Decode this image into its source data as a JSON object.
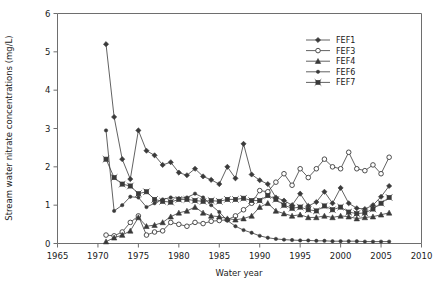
{
  "chart_data": {
    "type": "line",
    "title": "",
    "xlabel": "Water year",
    "ylabel": "Stream water nitrate concentrations (mg/L)",
    "xlim": [
      1965,
      2010
    ],
    "ylim": [
      0,
      6
    ],
    "xticks": [
      1965,
      1970,
      1975,
      1980,
      1985,
      1990,
      1995,
      2000,
      2005,
      2010
    ],
    "yticks": [
      0,
      1,
      2,
      3,
      4,
      5,
      6
    ],
    "grid": false,
    "legend_position": "top-right",
    "series": [
      {
        "name": "FEF1",
        "marker": "filled-diamond",
        "x": [
          1971,
          1972,
          1973,
          1974,
          1975,
          1976,
          1977,
          1978,
          1979,
          1980,
          1981,
          1982,
          1983,
          1984,
          1985,
          1986,
          1987,
          1988,
          1989,
          1990,
          1991,
          1992,
          1993,
          1994,
          1995,
          1996,
          1997,
          1998,
          1999,
          2000,
          2001,
          2002,
          2003,
          2004,
          2005,
          2006
        ],
        "values": [
          5.2,
          3.3,
          2.2,
          1.68,
          2.95,
          2.42,
          2.3,
          2.05,
          2.12,
          1.85,
          1.78,
          1.95,
          1.75,
          1.66,
          1.55,
          2.0,
          1.7,
          2.6,
          1.8,
          1.65,
          1.55,
          1.2,
          1.12,
          1.0,
          1.3,
          0.98,
          1.08,
          1.35,
          1.05,
          1.45,
          1.05,
          0.92,
          0.9,
          1.0,
          1.22,
          1.5
        ]
      },
      {
        "name": "FEF3",
        "marker": "open-circle",
        "x": [
          1971,
          1972,
          1973,
          1974,
          1975,
          1976,
          1977,
          1978,
          1979,
          1980,
          1981,
          1982,
          1983,
          1984,
          1985,
          1986,
          1987,
          1988,
          1989,
          1990,
          1991,
          1992,
          1993,
          1994,
          1995,
          1996,
          1997,
          1998,
          1999,
          2000,
          2001,
          2002,
          2003,
          2004,
          2005,
          2006
        ],
        "values": [
          0.22,
          0.2,
          0.3,
          0.55,
          0.72,
          0.22,
          0.3,
          0.33,
          0.55,
          0.5,
          0.45,
          0.55,
          0.52,
          0.58,
          0.6,
          0.62,
          0.72,
          0.88,
          1.05,
          1.38,
          1.35,
          1.6,
          1.82,
          1.52,
          1.95,
          1.72,
          1.95,
          2.2,
          2.0,
          1.95,
          2.38,
          1.95,
          1.9,
          2.05,
          1.82,
          2.25
        ]
      },
      {
        "name": "FEF4",
        "marker": "filled-triangle",
        "x": [
          1971,
          1972,
          1973,
          1974,
          1975,
          1976,
          1977,
          1978,
          1979,
          1980,
          1981,
          1982,
          1983,
          1984,
          1985,
          1986,
          1987,
          1988,
          1989,
          1990,
          1991,
          1992,
          1993,
          1994,
          1995,
          1996,
          1997,
          1998,
          1999,
          2000,
          2001,
          2002,
          2003,
          2004,
          2005,
          2006
        ],
        "values": [
          0.05,
          0.15,
          0.22,
          0.33,
          0.68,
          0.45,
          0.48,
          0.55,
          0.7,
          0.8,
          0.85,
          0.95,
          0.8,
          0.72,
          0.7,
          0.65,
          0.62,
          0.65,
          0.72,
          0.95,
          1.05,
          0.85,
          0.78,
          0.72,
          0.75,
          0.68,
          0.68,
          0.72,
          0.68,
          0.72,
          0.7,
          0.65,
          0.68,
          0.7,
          0.75,
          0.8
        ]
      },
      {
        "name": "FEF6",
        "marker": "filled-dot",
        "x": [
          1971,
          1972,
          1973,
          1974,
          1975,
          1976,
          1977,
          1978,
          1979,
          1980,
          1981,
          1982,
          1983,
          1984,
          1985,
          1986,
          1987,
          1988,
          1989,
          1990,
          1991,
          1992,
          1993,
          1994,
          1995,
          1996,
          1997,
          1998,
          1999,
          2000,
          2001,
          2002,
          2003,
          2004,
          2005,
          2006
        ],
        "values": [
          2.95,
          0.85,
          1.0,
          1.22,
          1.2,
          0.95,
          1.05,
          1.15,
          1.2,
          1.18,
          1.2,
          1.3,
          1.2,
          1.0,
          0.82,
          0.6,
          0.45,
          0.35,
          0.28,
          0.2,
          0.15,
          0.12,
          0.1,
          0.09,
          0.08,
          0.08,
          0.07,
          0.07,
          0.06,
          0.06,
          0.06,
          0.06,
          0.05,
          0.05,
          0.05,
          0.05
        ]
      },
      {
        "name": "FEF7",
        "marker": "filled-square-x",
        "x": [
          1971,
          1972,
          1973,
          1974,
          1975,
          1976,
          1977,
          1978,
          1979,
          1980,
          1981,
          1982,
          1983,
          1984,
          1985,
          1986,
          1987,
          1988,
          1989,
          1990,
          1991,
          1992,
          1993,
          1994,
          1995,
          1996,
          1997,
          1998,
          1999,
          2000,
          2001,
          2002,
          2003,
          2004,
          2005,
          2006
        ],
        "values": [
          2.2,
          1.72,
          1.55,
          1.5,
          1.3,
          1.35,
          1.15,
          1.1,
          1.08,
          1.15,
          1.15,
          1.12,
          1.1,
          1.12,
          1.1,
          1.15,
          1.15,
          1.18,
          1.12,
          1.12,
          1.25,
          1.15,
          1.0,
          0.92,
          0.95,
          0.88,
          0.85,
          0.98,
          0.88,
          0.95,
          0.82,
          0.78,
          0.8,
          0.9,
          1.05,
          1.2
        ]
      }
    ]
  },
  "legend": {
    "entries": [
      {
        "label": "FEF1"
      },
      {
        "label": "FEF3"
      },
      {
        "label": "FEF4"
      },
      {
        "label": "FEF6"
      },
      {
        "label": "FEF7"
      }
    ]
  },
  "axes": {
    "x_label": "Water year",
    "y_label": "Stream water nitrate concentrations (mg/L)",
    "x_tick_labels": [
      "1965",
      "1970",
      "1975",
      "1980",
      "1985",
      "1990",
      "1995",
      "2000",
      "2005",
      "2010"
    ],
    "y_tick_labels": [
      "0",
      "1",
      "2",
      "3",
      "4",
      "5",
      "6"
    ]
  },
  "colors": {
    "line": "#3a3a3a",
    "axis": "#6e6e6e",
    "text": "#1a1a1a",
    "background": "#ffffff"
  }
}
